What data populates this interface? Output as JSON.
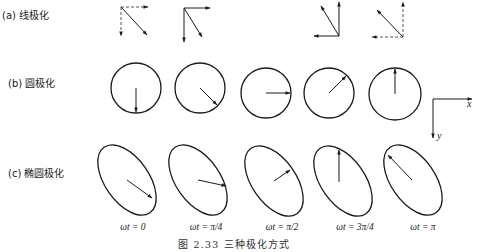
{
  "rows": {
    "linear": {
      "label": "(a) 线极化"
    },
    "circular": {
      "label": "(b) 圆极化"
    },
    "elliptical": {
      "label": "(c) 椭圆极化"
    }
  },
  "time_labels": [
    "ωt = 0",
    "ωt = π/4",
    "ωt = π/2",
    "ωt = 3π/4",
    "ωt = π"
  ],
  "axes": {
    "x": "x",
    "y": "y"
  },
  "caption": "图 2.33   三种极化方式",
  "colors": {
    "stroke": "#1a1a1a",
    "dashed": "#555555",
    "background": "#ffffff"
  }
}
